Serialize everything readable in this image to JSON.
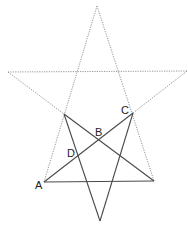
{
  "diagram": {
    "type": "geometry",
    "labels": {
      "A": "A",
      "B": "B",
      "C": "C",
      "D": "D"
    },
    "points": {
      "top": [
        97,
        6
      ],
      "left": [
        8,
        72
      ],
      "right": [
        187,
        71
      ],
      "A": [
        44,
        182
      ],
      "bottom_right": [
        154,
        181
      ],
      "bottom": [
        100,
        221
      ],
      "inner_left": [
        64,
        114
      ],
      "C": [
        133,
        113
      ],
      "B": [
        99,
        140
      ],
      "D": [
        80,
        160
      ]
    },
    "colors": {
      "dotted_line": "#8a8a8a",
      "solid_line": "#4a4a4a",
      "label": "#222222",
      "background": "#ffffff"
    }
  }
}
